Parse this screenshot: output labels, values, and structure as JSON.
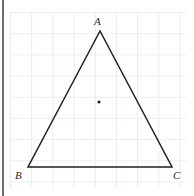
{
  "figure": {
    "type": "geometry-diagram",
    "canvas": {
      "width": 194,
      "height": 196,
      "background": "#ffffff"
    },
    "grid": {
      "visible": true,
      "line_color": "#f0eaec",
      "cell_size": 21.2,
      "left": 10,
      "top": 12,
      "width": 176,
      "height": 176
    },
    "left_gutter_bar": {
      "color": "#6e6e6e",
      "x": 2,
      "width": 2
    },
    "shape": {
      "name": "triangle",
      "stroke_color": "#1f1f1f",
      "stroke_width": 1.5,
      "fill": "none",
      "points": "100,31 28,167 172,167"
    },
    "vertices": [
      {
        "id": "A",
        "label": "A",
        "x": 100,
        "y": 31
      },
      {
        "id": "B",
        "label": "B",
        "x": 28,
        "y": 167
      },
      {
        "id": "C",
        "label": "C",
        "x": 172,
        "y": 167
      }
    ],
    "interior_point": {
      "label": "",
      "x": 99,
      "y": 102,
      "size": 2.6,
      "color": "#141414"
    }
  }
}
